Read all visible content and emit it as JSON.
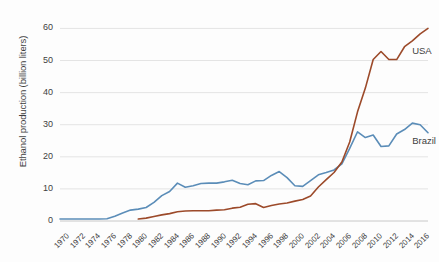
{
  "chart_data": {
    "type": "line",
    "title": "",
    "xlabel": "",
    "ylabel": "Ethanol production (billion liters)",
    "xlim": [
      1970,
      2017
    ],
    "ylim": [
      0,
      62
    ],
    "yticks": [
      0,
      10,
      20,
      30,
      40,
      50,
      60
    ],
    "xticks": [
      1970,
      1972,
      1974,
      1976,
      1978,
      1980,
      1982,
      1984,
      1986,
      1988,
      1990,
      1992,
      1994,
      1996,
      1998,
      2000,
      2002,
      2004,
      2006,
      2008,
      2010,
      2012,
      2014,
      2016
    ],
    "grid": "horizontal",
    "legend_position": "inline-right",
    "x": [
      1970,
      1971,
      1972,
      1973,
      1974,
      1975,
      1976,
      1977,
      1978,
      1979,
      1980,
      1981,
      1982,
      1983,
      1984,
      1985,
      1986,
      1987,
      1988,
      1989,
      1990,
      1991,
      1992,
      1993,
      1994,
      1995,
      1996,
      1997,
      1998,
      1999,
      2000,
      2001,
      2002,
      2003,
      2004,
      2005,
      2006,
      2007,
      2008,
      2009,
      2010,
      2011,
      2012,
      2013,
      2014,
      2015,
      2016,
      2017
    ],
    "series": [
      {
        "name": "Brazil",
        "color": "#5b8db8",
        "values": [
          0.6,
          0.6,
          0.6,
          0.6,
          0.6,
          0.6,
          0.7,
          1.5,
          2.5,
          3.4,
          3.7,
          4.2,
          5.8,
          7.9,
          9.2,
          11.8,
          10.5,
          11.0,
          11.7,
          11.8,
          11.8,
          12.2,
          12.7,
          11.7,
          11.3,
          12.5,
          12.6,
          14.2,
          15.4,
          13.5,
          11.0,
          10.8,
          12.6,
          14.4,
          15.1,
          15.9,
          17.8,
          22.6,
          27.8,
          26.0,
          26.8,
          23.2,
          23.4,
          27.1,
          28.5,
          30.5,
          30.0,
          27.5
        ]
      },
      {
        "name": "USA",
        "color": "#9c4a2a",
        "values": [
          null,
          null,
          null,
          null,
          null,
          null,
          null,
          null,
          null,
          null,
          0.6,
          0.9,
          1.4,
          1.9,
          2.3,
          2.9,
          3.1,
          3.2,
          3.2,
          3.2,
          3.4,
          3.5,
          4.0,
          4.3,
          5.2,
          5.4,
          4.2,
          4.8,
          5.3,
          5.6,
          6.2,
          6.7,
          7.8,
          10.6,
          12.9,
          15.1,
          18.4,
          24.6,
          34.0,
          41.4,
          50.3,
          52.8,
          50.3,
          50.3,
          54.3,
          56.1,
          58.3,
          60.0
        ]
      }
    ],
    "annotations": [
      {
        "text": "USA",
        "x": 2016,
        "y": 53
      },
      {
        "text": "Brazil",
        "x": 2016,
        "y": 25
      }
    ]
  },
  "axis": {
    "ylabel_text": "Ethanol production (billion liters)"
  }
}
